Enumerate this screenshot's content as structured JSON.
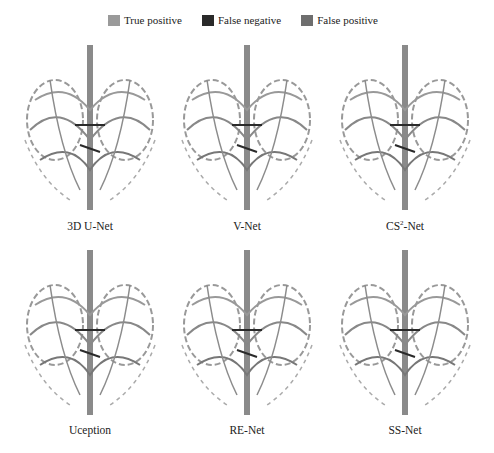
{
  "legend": [
    {
      "label": "True positive",
      "color": "#9a9a9a"
    },
    {
      "label": "False negative",
      "color": "#2a2a2a"
    },
    {
      "label": "False positive",
      "color": "#6e6e6e"
    }
  ],
  "panels": [
    {
      "label": "3D U-Net"
    },
    {
      "label": "V-Net"
    },
    {
      "label": "CS2-Net",
      "label_base": "CS",
      "label_sup": "2",
      "label_suffix": "-Net"
    },
    {
      "label": "Uception"
    },
    {
      "label": "RE-Net"
    },
    {
      "label": "SS-Net"
    }
  ]
}
